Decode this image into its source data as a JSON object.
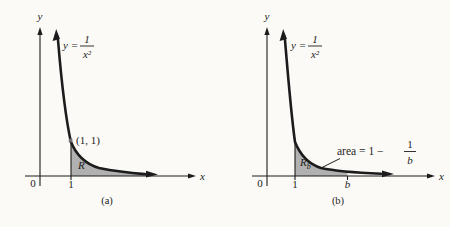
{
  "colors": {
    "background": "#fbfaf7",
    "ink": "#1c1c1c",
    "region_shade": "#b1b1b1",
    "point_dot": "#6f6f6f"
  },
  "panel_a": {
    "y_axis_label": "y",
    "x_axis_label": "x",
    "equation": {
      "lhs": "y =",
      "numerator": "1",
      "denominator": "x²"
    },
    "point_label": "(1, 1)",
    "region_label": "R",
    "origin_label": "0",
    "x_tick_1": "1",
    "caption": "(a)"
  },
  "panel_b": {
    "y_axis_label": "y",
    "x_axis_label": "x",
    "equation": {
      "lhs": "y =",
      "numerator": "1",
      "denominator": "x²"
    },
    "region_label": {
      "base": "R",
      "sub": "b"
    },
    "area_label": {
      "prefix": "area = 1 −",
      "numerator": "1",
      "denominator": "b"
    },
    "origin_label": "0",
    "x_tick_1": "1",
    "x_tick_b": "b",
    "caption": "(b)"
  }
}
